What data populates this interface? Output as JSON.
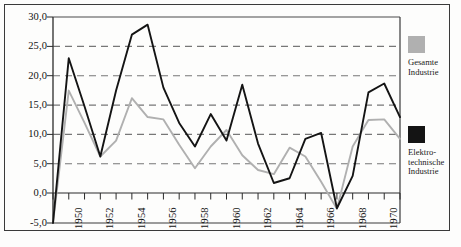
{
  "chart_data": {
    "type": "line",
    "title": "",
    "subtitle": "",
    "xlabel": "",
    "ylabel": "",
    "xlim": [
      1949,
      1971
    ],
    "ylim": [
      -5.0,
      30.0
    ],
    "grid": true,
    "grid_style": "dashed-horizontal",
    "legend_position": "right",
    "y_ticks": [
      "30,0",
      "25,0",
      "20,0",
      "15,0",
      "10,0",
      "5,0",
      "0,0",
      "-5,0"
    ],
    "y_tick_values": [
      30.0,
      25.0,
      20.0,
      15.0,
      10.0,
      5.0,
      0.0,
      -5.0
    ],
    "x_tick_labels": [
      "1950",
      "1952",
      "1954",
      "1956",
      "1958",
      "1960",
      "1962",
      "1964",
      "1966",
      "1968",
      "1970"
    ],
    "x_minor_tick_years": [
      1949,
      1950,
      1951,
      1952,
      1953,
      1954,
      1955,
      1956,
      1957,
      1958,
      1959,
      1960,
      1961,
      1962,
      1963,
      1964,
      1965,
      1966,
      1967,
      1968,
      1969,
      1970,
      1971
    ],
    "x": [
      1949,
      1950,
      1951,
      1952,
      1953,
      1954,
      1955,
      1956,
      1957,
      1958,
      1959,
      1960,
      1961,
      1962,
      1963,
      1964,
      1965,
      1966,
      1967,
      1968,
      1969,
      1970,
      1971
    ],
    "series": [
      {
        "name": "Gesamte Industrie",
        "color": "#b0b0b0",
        "values": [
          -5.0,
          17.5,
          12.0,
          6.3,
          9.0,
          16.2,
          13.0,
          12.6,
          8.3,
          4.3,
          8.0,
          10.8,
          6.5,
          4.0,
          3.3,
          7.8,
          6.3,
          2.0,
          -2.6,
          8.0,
          12.5,
          12.6,
          9.3
        ]
      },
      {
        "name": "Elektrotechnische Industrie",
        "color": "#141414",
        "values": [
          -5.0,
          23.0,
          14.8,
          6.3,
          17.5,
          27.0,
          28.7,
          18.0,
          12.0,
          8.0,
          13.5,
          9.0,
          18.5,
          8.5,
          1.8,
          2.6,
          9.3,
          10.3,
          -2.5,
          3.0,
          17.2,
          18.7,
          13.0
        ]
      }
    ]
  },
  "legend": {
    "entries": [
      {
        "swatch_color": "#b0b0b0",
        "label": "Gesamte Industrie",
        "line_1": "Gesamte",
        "line_2": "Industrie"
      },
      {
        "swatch_color": "#141414",
        "label": "Elektro- technische Industrie",
        "line_1": "Elektro-",
        "line_2": "technische",
        "line_3": "Industrie"
      }
    ]
  },
  "axis": {
    "y_label_0": "30,0",
    "y_label_1": "25,0",
    "y_label_2": "20,0",
    "y_label_3": "15,0",
    "y_label_4": "10,0",
    "y_label_5": "5,0",
    "y_label_6": "0,0",
    "y_label_7": "-5,0",
    "x_label_0": "1950",
    "x_label_1": "1952",
    "x_label_2": "1954",
    "x_label_3": "1956",
    "x_label_4": "1958",
    "x_label_5": "1960",
    "x_label_6": "1962",
    "x_label_7": "1964",
    "x_label_8": "1966",
    "x_label_9": "1968",
    "x_label_10": "1970"
  },
  "colors": {
    "frame": "#3a3a3a",
    "grid": "#777777",
    "series_total": "#b0b0b0",
    "series_electro": "#141414",
    "background": "#fdfdfc"
  }
}
